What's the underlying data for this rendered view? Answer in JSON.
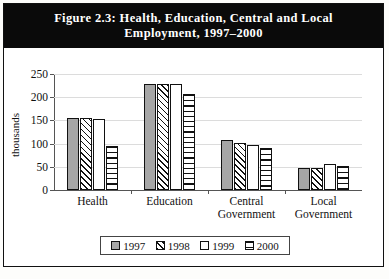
{
  "figure": {
    "number": "Figure 2.3:",
    "title_line1": "Health, Education, Central and Local",
    "title_line2": "Employment, 1997–2000"
  },
  "legend": {
    "items": [
      {
        "label": "1997",
        "pattern": "solid-gray"
      },
      {
        "label": "1998",
        "pattern": "diagonal-hatch"
      },
      {
        "label": "1999",
        "pattern": "white"
      },
      {
        "label": "2000",
        "pattern": "horizontal-lines"
      }
    ]
  },
  "chart_data": {
    "type": "bar",
    "title": "Figure 2.3: Health, Education, Central and Local Employment, 1997–2000",
    "xlabel": "",
    "ylabel": "thousands",
    "ylim": [
      0,
      250
    ],
    "yticks": [
      0,
      50,
      100,
      150,
      200,
      250
    ],
    "ytick_labels": [
      "0",
      "50",
      "100",
      "150",
      "200",
      "250"
    ],
    "grid": true,
    "legend_position": "bottom",
    "categories": [
      "Health",
      "Education",
      "Central Government",
      "Local Government"
    ],
    "category_labels": [
      [
        "Health"
      ],
      [
        "Education"
      ],
      [
        "Central",
        "Government"
      ],
      [
        "Local",
        "Government"
      ]
    ],
    "series": [
      {
        "name": "1997",
        "values": [
          155,
          228,
          107,
          48
        ]
      },
      {
        "name": "1998",
        "values": [
          155,
          228,
          101,
          48
        ]
      },
      {
        "name": "1999",
        "values": [
          153,
          228,
          96,
          57
        ]
      },
      {
        "name": "2000",
        "values": [
          95,
          208,
          91,
          52
        ]
      }
    ]
  }
}
